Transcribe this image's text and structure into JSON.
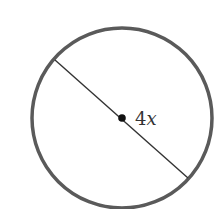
{
  "diagram": {
    "shape": "circle",
    "segment": "diameter",
    "label_number": "4",
    "label_variable": "x",
    "colors": {
      "stroke": "#555555",
      "line": "#333333",
      "text": "#333333"
    }
  }
}
